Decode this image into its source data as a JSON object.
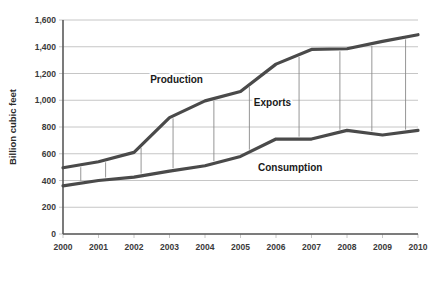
{
  "chart_data": {
    "type": "line",
    "title": "",
    "subtitle": "",
    "xlabel": "",
    "ylabel": "Billion cubic feet",
    "categories": [
      "2000",
      "2001",
      "2002",
      "2003",
      "2004",
      "2005",
      "2006",
      "2007",
      "2008",
      "2009",
      "2010"
    ],
    "x": [
      2000,
      2001,
      2002,
      2003,
      2004,
      2005,
      2006,
      2007,
      2008,
      2009,
      2010
    ],
    "xlim": [
      2000,
      2010
    ],
    "ylim": [
      0,
      1600
    ],
    "yticks": [
      0,
      200,
      400,
      600,
      800,
      1000,
      1200,
      1400,
      1600
    ],
    "ytick_labels": [
      "0",
      "200",
      "400",
      "600",
      "800",
      "1,000",
      "1,200",
      "1,400",
      "1,600"
    ],
    "grid": "horizontal",
    "legend": "inline-annotations",
    "series": [
      {
        "name": "Production",
        "values": [
          495,
          540,
          610,
          870,
          995,
          1065,
          1270,
          1380,
          1385,
          1440,
          1490
        ]
      },
      {
        "name": "Consumption",
        "values": [
          360,
          400,
          425,
          470,
          510,
          580,
          710,
          710,
          775,
          740,
          775
        ]
      }
    ],
    "annotations": [
      {
        "text": "Production",
        "series": "Production",
        "x": 2003.2,
        "y": 1130
      },
      {
        "text": "Exports",
        "series": "Exports",
        "x": 2005.9,
        "y": 955
      },
      {
        "text": "Consumption",
        "series": "Consumption",
        "x": 2006.4,
        "y": 470
      }
    ],
    "exports_gap": {
      "description": "Vertical connector lines between Production and Consumption representing Exports",
      "positions": [
        2000.5,
        2001.2,
        2002.2,
        2003.1,
        2004.25,
        2005.25,
        2006.65,
        2007.8,
        2008.7,
        2009.65
      ]
    },
    "colors": {
      "line": "#4a4a4a",
      "grid": "#b8b8b8",
      "axis": "#5a5a5a",
      "connector": "#8a8a8a",
      "text": "#2b2b2b",
      "background": "#ffffff"
    }
  }
}
